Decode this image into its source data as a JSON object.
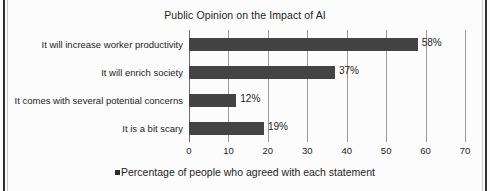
{
  "chart_data": {
    "type": "bar",
    "orientation": "horizontal",
    "title": "Public Opinion on the Impact of AI",
    "xlabel": "",
    "ylabel": "",
    "xlim": [
      0,
      70
    ],
    "xticks": [
      0,
      10,
      20,
      30,
      40,
      50,
      60,
      70
    ],
    "grid": true,
    "legend_position": "bottom",
    "categories": [
      "It will increase worker productivity",
      "It will enrich society",
      "It comes with several potential concerns",
      "It is a bit scary"
    ],
    "values": [
      58,
      37,
      12,
      19
    ],
    "data_labels": [
      "58%",
      "37%",
      "12%",
      "19%"
    ],
    "series": [
      {
        "name": "Percentage of people who agreed with each statement",
        "values": [
          58,
          37,
          12,
          19
        ],
        "color": "#434343"
      }
    ],
    "legend": [
      {
        "label": "Percentage of people who agreed with each statement",
        "color": "#434343"
      }
    ]
  },
  "colors": {
    "bar": "#434343",
    "gridline": "#9a9a9a",
    "axis": "#6d6d6d",
    "text": "#1d1d1d",
    "background": "#fcfcfc",
    "page_edge": "#2f2f2f"
  }
}
